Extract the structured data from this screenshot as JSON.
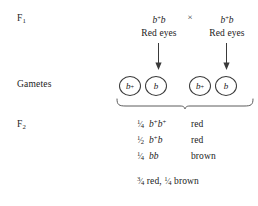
{
  "diagram": {
    "cross_symbol": "×",
    "stages": {
      "f1_label": "F",
      "f1_sub": "1",
      "gametes_label": "Gametes",
      "f2_label": "F",
      "f2_sub": "2"
    },
    "parents": [
      {
        "gene": "b",
        "allele_sup": "+",
        "allele2": "b",
        "genotype_text": "b⁺b",
        "phenotype": "Red eyes"
      },
      {
        "gene": "b",
        "allele_sup": "+",
        "allele2": "b",
        "genotype_text": "b⁺b",
        "phenotype": "Red eyes"
      }
    ],
    "gametes": [
      {
        "parent": "left",
        "cells": [
          {
            "gene": "b",
            "sup": "+"
          },
          {
            "gene": "b",
            "sup": ""
          }
        ]
      },
      {
        "parent": "right",
        "cells": [
          {
            "gene": "b",
            "sup": "+"
          },
          {
            "gene": "b",
            "sup": ""
          }
        ]
      }
    ],
    "offspring": [
      {
        "fraction_num": "1",
        "fraction_den": "4",
        "fraction_text": "1/4",
        "genotype_prefix": "b",
        "genotype_sup": "+",
        "genotype_suffix": "b",
        "genotype_sup2": "+",
        "genotype_text": "b⁺b⁺",
        "phenotype": "red"
      },
      {
        "fraction_num": "1",
        "fraction_den": "2",
        "fraction_text": "1/2",
        "genotype_prefix": "b",
        "genotype_sup": "+",
        "genotype_suffix": "b",
        "genotype_sup2": "",
        "genotype_text": "b⁺b",
        "phenotype": "red"
      },
      {
        "fraction_num": "1",
        "fraction_den": "4",
        "fraction_text": "1/4",
        "genotype_prefix": "b",
        "genotype_sup": "",
        "genotype_suffix": "b",
        "genotype_sup2": "",
        "genotype_text": "bb",
        "phenotype": "brown"
      }
    ],
    "summary": {
      "first_num": "3",
      "first_den": "4",
      "first_pheno": "red,",
      "second_num": "1",
      "second_den": "4",
      "second_pheno": "brown",
      "full_text": "3/4 red, 1/4 brown"
    },
    "colors": {
      "text": "#1a1a1a",
      "line": "#3a3a3a",
      "background": "#ffffff"
    }
  }
}
